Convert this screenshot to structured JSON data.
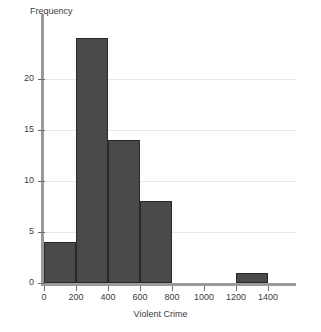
{
  "chart_data": {
    "type": "bar",
    "title": "",
    "subtitle": "",
    "xlabel": "Violent Crime",
    "ylabel": "Frequency",
    "xlim": [
      0,
      1400
    ],
    "ylim": [
      0,
      25
    ],
    "grid": true,
    "legend": false,
    "bin_width": 200,
    "bar_color": "#4a4a4a",
    "bar_edge_color": "#2a2a2a",
    "grid_color": "#e9e9e9",
    "axis_color": "#9a9a9a",
    "categories": [
      "0-200",
      "200-400",
      "400-600",
      "600-800",
      "800-1000",
      "1000-1200",
      "1200-1400"
    ],
    "bin_edges": [
      0,
      200,
      400,
      600,
      800,
      1000,
      1200,
      1400
    ],
    "values": [
      4,
      24,
      14,
      8,
      0,
      0,
      1
    ],
    "bars": [
      {
        "label": "0-200",
        "x0": 0,
        "x1": 200,
        "value": 4
      },
      {
        "label": "200-400",
        "x0": 200,
        "x1": 400,
        "value": 24
      },
      {
        "label": "400-600",
        "x0": 400,
        "x1": 600,
        "value": 14
      },
      {
        "label": "600-800",
        "x0": 600,
        "x1": 800,
        "value": 8
      },
      {
        "label": "1200-1400",
        "x0": 1200,
        "x1": 1400,
        "value": 1
      }
    ],
    "xticks": [
      0,
      200,
      400,
      600,
      800,
      1000,
      1200,
      1400
    ],
    "xtick_labels": [
      "0",
      "200",
      "400",
      "600",
      "800",
      "1000",
      "1200",
      "1400"
    ],
    "yticks": [
      0,
      5,
      10,
      15,
      20
    ],
    "ytick_labels": [
      "0",
      "5",
      "10",
      "15",
      "20"
    ]
  }
}
